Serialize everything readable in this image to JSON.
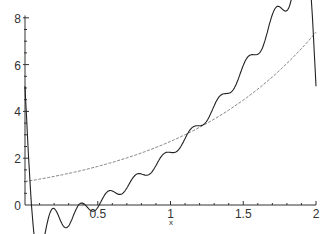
{
  "chart_data": {
    "type": "line",
    "title": "",
    "xlabel": "x",
    "ylabel": "",
    "xlim": [
      0,
      2
    ],
    "ylim": [
      0,
      8
    ],
    "grid": false,
    "legend": null,
    "x_ticks": [
      "0",
      "0.5",
      "1",
      "1.5",
      "2"
    ],
    "y_ticks": [
      "0",
      "2",
      "4",
      "6",
      "8"
    ],
    "series": [
      {
        "name": "exp(x)",
        "style": "dashed",
        "color": "#555555",
        "x": [
          0,
          0.25,
          0.5,
          0.75,
          1.0,
          1.25,
          1.5,
          1.75,
          2.0
        ],
        "values": [
          1.0,
          1.28,
          1.65,
          2.12,
          2.72,
          3.49,
          4.48,
          5.75,
          7.39
        ]
      },
      {
        "name": "Fourier partial sum approximation",
        "style": "solid",
        "color": "#222222",
        "x": [
          0,
          0.05,
          0.1,
          0.2,
          0.3,
          0.4,
          0.5,
          0.6,
          0.7,
          0.8,
          0.9,
          1.0,
          1.1,
          1.2,
          1.3,
          1.4,
          1.5,
          1.6,
          1.65,
          1.7,
          1.75,
          1.8,
          1.85,
          1.9,
          1.95,
          2.0
        ],
        "values": [
          0.0,
          1.1,
          1.3,
          1.15,
          1.45,
          1.4,
          1.75,
          1.7,
          2.1,
          2.0,
          2.55,
          2.55,
          3.1,
          3.05,
          3.75,
          3.7,
          4.6,
          4.4,
          5.2,
          6.0,
          5.3,
          4.8,
          6.5,
          8.0,
          6.0,
          0.0
        ]
      }
    ]
  },
  "axes": {
    "x_label": "x",
    "x_tick_labels": [
      "0.5",
      "1",
      "1.5",
      "2"
    ],
    "y_tick_labels": [
      "0",
      "2",
      "4",
      "6",
      "8"
    ]
  }
}
